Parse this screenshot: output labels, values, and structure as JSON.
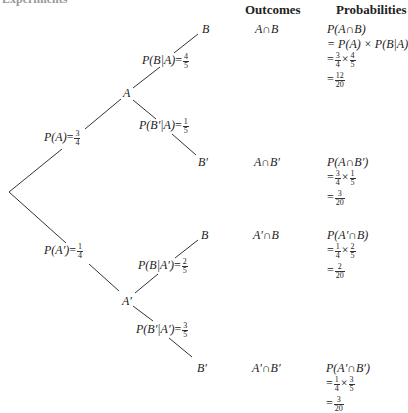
{
  "page": {
    "cut_heading": "Experiments"
  },
  "headers": {
    "outcomes": "Outcomes",
    "probabilities": "Probabilities"
  },
  "tree": {
    "first_stage": [
      {
        "event": "A",
        "prob_label": "P(A)",
        "num": "3",
        "den": "4"
      },
      {
        "event": "A′",
        "prob_label": "P(A′)",
        "num": "1",
        "den": "4"
      }
    ],
    "second_stage": [
      {
        "from": "A",
        "event": "B",
        "prob_label": "P(B|A)",
        "num": "4",
        "den": "5"
      },
      {
        "from": "A",
        "event": "B′",
        "prob_label": "P(B′|A)",
        "num": "1",
        "den": "5"
      },
      {
        "from": "A′",
        "event": "B",
        "prob_label": "P(B|A′)",
        "num": "2",
        "den": "5"
      },
      {
        "from": "A′",
        "event": "B′",
        "prob_label": "P(B′|A′)",
        "num": "3",
        "den": "5"
      }
    ]
  },
  "rows": [
    {
      "outcome": "A∩B",
      "prob_title": "P(A∩B)",
      "general": "= P(A) × P(B|A)",
      "f1n": "3",
      "f1d": "4",
      "f2n": "4",
      "f2d": "5",
      "rn": "12",
      "rd": "20"
    },
    {
      "outcome": "A∩B′",
      "prob_title": "P(A∩B′)",
      "f1n": "3",
      "f1d": "4",
      "f2n": "1",
      "f2d": "5",
      "rn": "3",
      "rd": "20"
    },
    {
      "outcome": "A′∩B",
      "prob_title": "P(A′∩B)",
      "f1n": "1",
      "f1d": "4",
      "f2n": "2",
      "f2d": "5",
      "rn": "2",
      "rd": "20"
    },
    {
      "outcome": "A′∩B′",
      "prob_title": "P(A′∩B′)",
      "f1n": "1",
      "f1d": "4",
      "f2n": "3",
      "f2d": "5",
      "rn": "3",
      "rd": "20"
    }
  ],
  "symbols": {
    "eq": "=",
    "times": "×"
  }
}
